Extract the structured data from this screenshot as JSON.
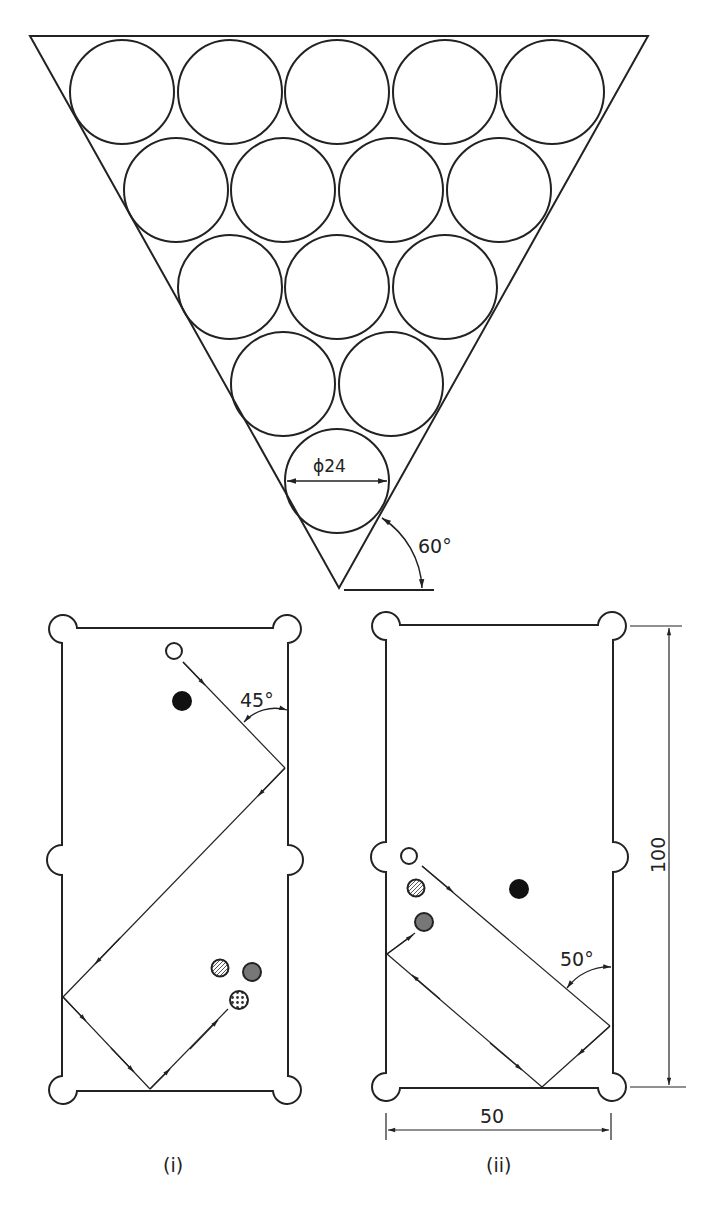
{
  "figure": {
    "triangle": {
      "diameter_label": "ϕ24",
      "angle_label": "60°",
      "rows": [
        5,
        4,
        3,
        2,
        1
      ]
    },
    "table_i": {
      "caption": "(i)",
      "angle_label": "45°"
    },
    "table_ii": {
      "caption": "(ii)",
      "angle_label": "50°",
      "height_label": "100",
      "width_label": "50"
    },
    "colors": {
      "stroke": "#222222",
      "solid_ball": "#111111",
      "grey_ball": "#777777",
      "background": "#ffffff"
    }
  }
}
